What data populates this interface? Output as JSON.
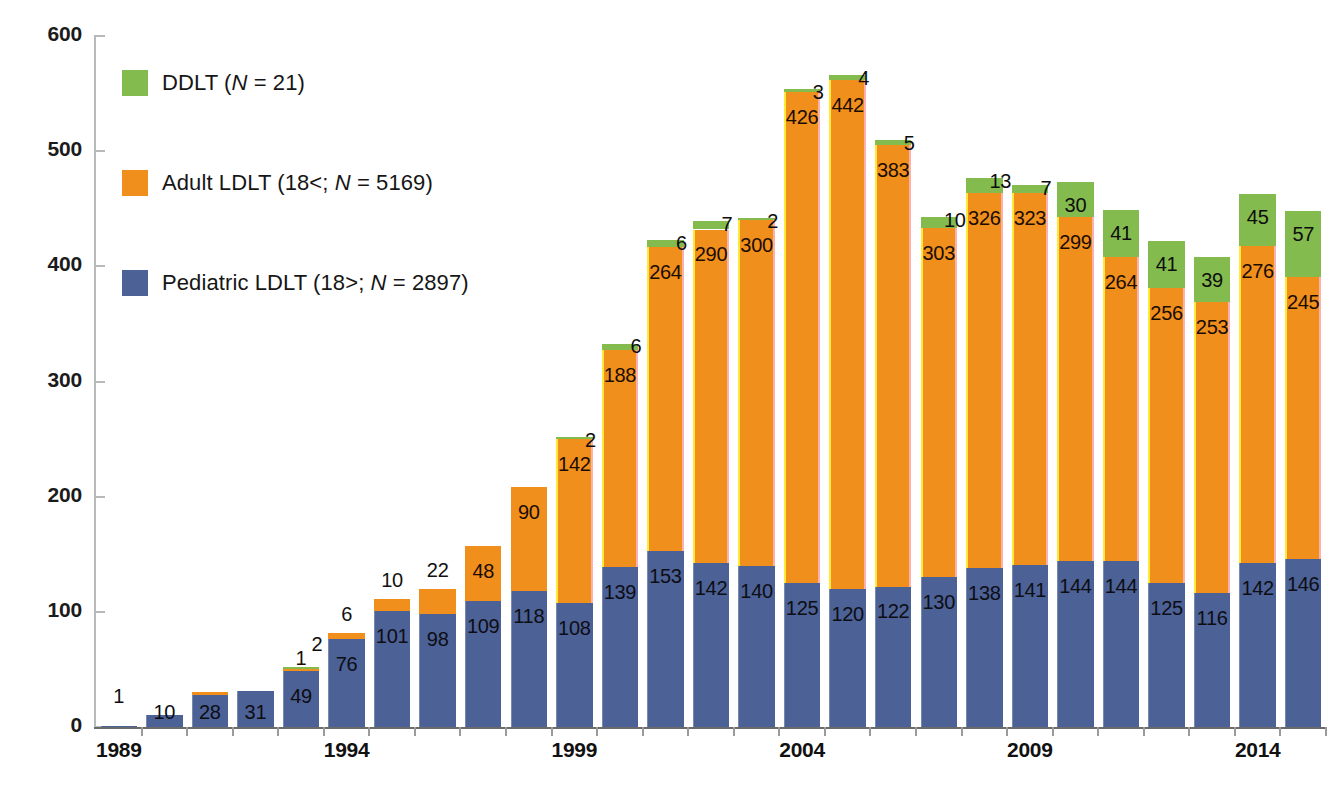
{
  "chart_data": {
    "type": "bar",
    "subtype": "stacked",
    "title": "",
    "xlabel": "",
    "ylabel": "",
    "ylim": [
      0,
      600
    ],
    "ytick_values": [
      0,
      100,
      200,
      300,
      400,
      500,
      600
    ],
    "ytick_labels": [
      "0",
      "100",
      "200",
      "300",
      "400",
      "500",
      "600"
    ],
    "grid": false,
    "legend_position": "upper-left inside plot",
    "categories": [
      "1989",
      "1990",
      "1991",
      "1992",
      "1993",
      "1994",
      "1995",
      "1996",
      "1997",
      "1998",
      "1999",
      "2000",
      "2001",
      "2002",
      "2003",
      "2004",
      "2005",
      "2006",
      "2007",
      "2008",
      "2009",
      "2010",
      "2011",
      "2012",
      "2013",
      "2014",
      "2015"
    ],
    "xtick_labels_shown": [
      "1989",
      "1994",
      "1999",
      "2004",
      "2009",
      "2014"
    ],
    "series": [
      {
        "name": "Pediatric LDLT (18>; N = 2897)",
        "key": "pediatric",
        "color": "#4c6195",
        "values": [
          1,
          10,
          28,
          31,
          49,
          76,
          101,
          98,
          109,
          118,
          108,
          139,
          153,
          142,
          140,
          125,
          120,
          122,
          130,
          138,
          141,
          144,
          144,
          125,
          116,
          142,
          146
        ]
      },
      {
        "name": "Adult LDLT (18<; N = 5169)",
        "key": "adult",
        "color": "#f18f1d",
        "values": [
          0,
          0,
          2,
          0,
          1,
          6,
          10,
          22,
          48,
          90,
          142,
          188,
          264,
          290,
          300,
          426,
          442,
          383,
          303,
          326,
          323,
          299,
          264,
          256,
          253,
          276,
          245
        ]
      },
      {
        "name": "DDLT (N = 21)",
        "key": "ddlt",
        "color": "#84bb4e",
        "values": [
          0,
          0,
          0,
          0,
          2,
          0,
          0,
          0,
          0,
          0,
          2,
          6,
          6,
          7,
          2,
          3,
          4,
          5,
          10,
          13,
          7,
          30,
          41,
          41,
          39,
          45,
          57
        ]
      }
    ],
    "bar_labels": {
      "pediatric": [
        "1",
        "10",
        "28",
        "31",
        "49",
        "76",
        "101",
        "98",
        "109",
        "118",
        "108",
        "139",
        "153",
        "142",
        "140",
        "125",
        "120",
        "122",
        "130",
        "138",
        "141",
        "144",
        "144",
        "125",
        "116",
        "142",
        "146"
      ],
      "adult": [
        "",
        "",
        "",
        "",
        "1",
        "",
        "",
        "",
        "48",
        "90",
        "142",
        "188",
        "264",
        "290",
        "300",
        "426",
        "442",
        "383",
        "303",
        "326",
        "323",
        "299",
        "264",
        "256",
        "253",
        "276",
        "245"
      ],
      "ddlt": [
        "",
        "",
        "",
        "",
        "2",
        "",
        "",
        "",
        "",
        "",
        "2",
        "6",
        "6",
        "7",
        "2",
        "3",
        "4",
        "5",
        "10",
        "13",
        "7",
        "30",
        "41",
        "41",
        "39",
        "45",
        "57"
      ],
      "above_bar": [
        "",
        "",
        "",
        "",
        "2",
        "6",
        "10",
        "22",
        "",
        "",
        "",
        "",
        "",
        "",
        "",
        "",
        "",
        "",
        "",
        "",
        "",
        "",
        "",
        "",
        "",
        "",
        ""
      ]
    }
  },
  "legend": {
    "items": [
      {
        "label_before_n": "DDLT (",
        "n_italic": "N",
        "label_after_n": " = 21)",
        "color": "#84bb4e"
      },
      {
        "label_before_n": "Adult LDLT (18<; ",
        "n_italic": "N",
        "label_after_n": " = 5169)",
        "color": "#f18f1d"
      },
      {
        "label_before_n": "Pediatric LDLT (18>; ",
        "n_italic": "N",
        "label_after_n": " = 2897)",
        "color": "#4c6195"
      }
    ]
  },
  "axis": {
    "y_labels": [
      "600",
      "500",
      "400",
      "300",
      "200",
      "100",
      "0"
    ],
    "x_labels": [
      "1989",
      "1994",
      "1999",
      "2004",
      "2009",
      "2014"
    ]
  }
}
